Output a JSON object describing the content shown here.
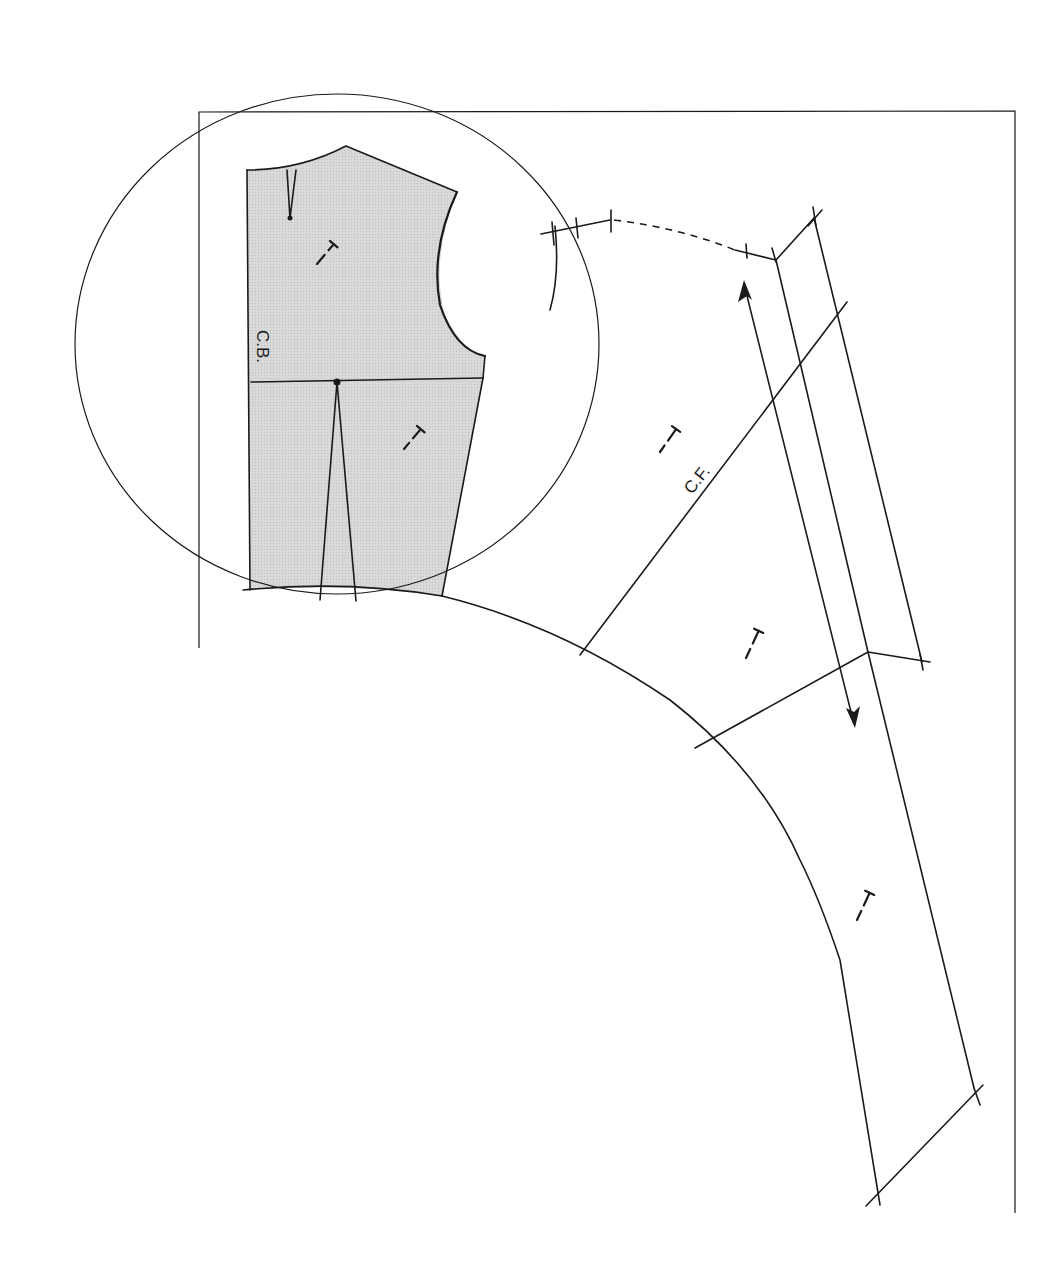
{
  "diagram": {
    "colors": {
      "line": "#1a1a1a",
      "shaded_fill": "#d6d6d6",
      "background": "#ffffff"
    },
    "labels": {
      "center_back": "C.B.",
      "center_front": "C.F."
    },
    "elements": {
      "frame": "rectangular pattern-paper frame",
      "circle": "magnifying circle around back bodice block",
      "back_bodice": "shaded back bodice block with shoulder dart and waist dart",
      "front_panel": "curved front panel with C.F. line",
      "facing_band": "parallel facing / band strips",
      "grainline": "double-headed grainline arrow",
      "neckline": "dashed neckline curve",
      "grain_marks": 5
    }
  }
}
